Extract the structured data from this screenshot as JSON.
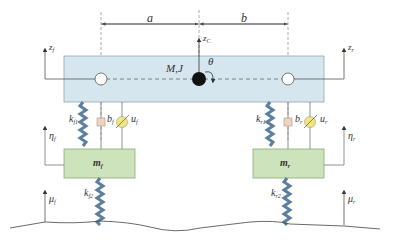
{
  "diagram": {
    "colors": {
      "body_fill": "#d6e6ef",
      "body_stroke": "#8fa6b3",
      "mass_fill": "#cde3bb",
      "mass_stroke": "#8aa77a",
      "spring": "#5d7f9e",
      "damper_fill": "#f3d2bd",
      "actuator_fill": "#f2e57a",
      "line": "#555555",
      "cg": "#111111"
    },
    "dimensions": {
      "a_label": "a",
      "b_label": "b"
    },
    "body": {
      "label_main": "M,J",
      "theta_label": "θ",
      "zc_label": "z",
      "zc_sub": "C",
      "zf_label": "z",
      "zf_sub": "f",
      "zr_label": "z",
      "zr_sub": "r"
    },
    "front": {
      "ks_label": "k",
      "ks_sub": "f1",
      "b_label": "b",
      "b_sub": "f",
      "u_label": "u",
      "u_sub": "f",
      "eta_label": "η",
      "eta_sub": "f",
      "mass_label": "m",
      "mass_sub": "f",
      "kt_label": "k",
      "kt_sub": "f2",
      "mu_label": "μ",
      "mu_sub": "f"
    },
    "rear": {
      "ks_label": "k",
      "ks_sub": "r1",
      "b_label": "b",
      "b_sub": "r",
      "u_label": "u",
      "u_sub": "r",
      "eta_label": "η",
      "eta_sub": "r",
      "mass_label": "m",
      "mass_sub": "r",
      "kt_label": "k",
      "kt_sub": "r2",
      "mu_label": "μ",
      "mu_sub": "r"
    }
  }
}
